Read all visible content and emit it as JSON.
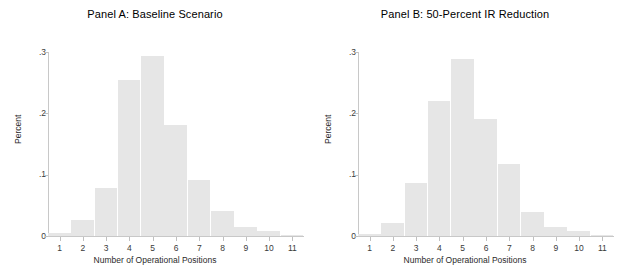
{
  "figure": {
    "background": "#ffffff",
    "bar_color": "#e6e6e6",
    "axis_color": "#c8c8c8"
  },
  "panels": [
    {
      "id": "panel-a",
      "title": "Panel A: Baseline Scenario",
      "ylabel": "Percent",
      "xlabel": "Number of Operational Positions"
    },
    {
      "id": "panel-b",
      "title": "Panel B: 50-Percent IR Reduction",
      "ylabel": "Percent",
      "xlabel": "Number of Operational Positions"
    }
  ],
  "axes": {
    "y_ticks": [
      "0",
      ".1",
      ".2",
      ".3"
    ],
    "y_tick_values": [
      0,
      0.1,
      0.2,
      0.3
    ],
    "x_ticks": [
      "1",
      "2",
      "3",
      "4",
      "5",
      "6",
      "7",
      "8",
      "9",
      "10",
      "11"
    ],
    "ylim": [
      0,
      0.31
    ],
    "xlim": [
      0.5,
      11.5
    ]
  },
  "chart_data": [
    {
      "type": "bar",
      "title": "Panel A: Baseline Scenario",
      "xlabel": "Number of Operational Positions",
      "ylabel": "Percent",
      "categories": [
        "1",
        "2",
        "3",
        "4",
        "5",
        "6",
        "7",
        "8",
        "9",
        "10",
        "11"
      ],
      "values": [
        0.005,
        0.026,
        0.078,
        0.255,
        0.293,
        0.181,
        0.092,
        0.04,
        0.015,
        0.008,
        0.002
      ],
      "ylim": [
        0,
        0.31
      ],
      "xlim": [
        0.5,
        11.5
      ],
      "grid": false,
      "legend": "none",
      "bar_color": "#e6e6e6"
    },
    {
      "type": "bar",
      "title": "Panel B: 50-Percent IR Reduction",
      "xlabel": "Number of Operational Positions",
      "ylabel": "Percent",
      "categories": [
        "1",
        "2",
        "3",
        "4",
        "5",
        "6",
        "7",
        "8",
        "9",
        "10",
        "11"
      ],
      "values": [
        0.004,
        0.022,
        0.087,
        0.22,
        0.288,
        0.191,
        0.118,
        0.039,
        0.015,
        0.008,
        0.002
      ],
      "ylim": [
        0,
        0.31
      ],
      "xlim": [
        0.5,
        11.5
      ],
      "grid": false,
      "legend": "none",
      "bar_color": "#e6e6e6"
    }
  ]
}
